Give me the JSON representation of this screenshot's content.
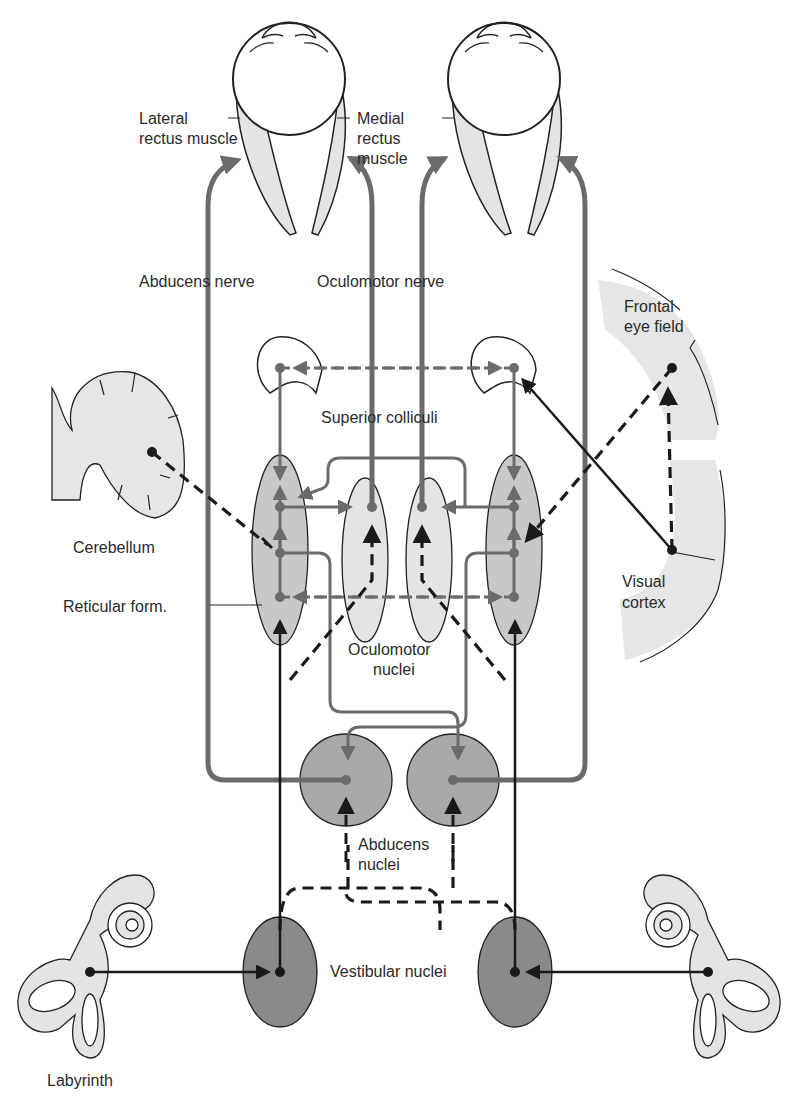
{
  "figure": {
    "labels": {
      "lateral_rectus": "Lateral",
      "lateral_rectus_2": "rectus muscle",
      "medial_rectus": "Medial",
      "medial_rectus_2": "rectus",
      "medial_rectus_3": "muscle",
      "abducens_nerve": "Abducens nerve",
      "oculomotor_nerve": "Oculomotor nerve",
      "frontal_eye_field": "Frontal",
      "frontal_eye_field_2": "eye field",
      "superior_colliculi": "Superior colliculi",
      "cerebellum": "Cerebellum",
      "reticular_form": "Reticular form.",
      "visual_cortex": "Visual",
      "visual_cortex_2": "cortex",
      "oculomotor_nuclei": "Oculomotor",
      "oculomotor_nuclei_2": "nuclei",
      "abducens_nuclei": "Abducens",
      "abducens_nuclei_2": "nuclei",
      "vestibular_nuclei": "Vestibular nuclei",
      "labyrinth": "Labyrinth"
    },
    "colors": {
      "pathway_gray": "#6b6b6b",
      "pathway_black": "#1a1a1a",
      "light_fill": "#e4e4e4",
      "mid_fill": "#c8c8c8",
      "dark_fill": "#8a8a8a",
      "abducens_fill": "#a9a9a9"
    }
  }
}
